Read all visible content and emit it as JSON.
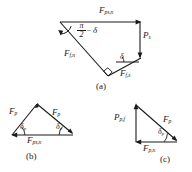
{
  "figure": {
    "background": "#ffffff",
    "line_color": "#1a1a1a",
    "text_color": "#1a1a1a"
  },
  "panels": [
    {
      "id": "a",
      "caption": "(a)",
      "labels": {
        "top_force": "F",
        "top_force_sub": "ps,n",
        "right_force": "P",
        "right_force_sub": "s",
        "left_force": "F",
        "left_force_sub": "f,n",
        "lower_force": "F",
        "lower_force_sub": "f,s",
        "angle_numerator": "π",
        "angle_denominator": "2",
        "angle_minus": "−",
        "angle_delta": "δ",
        "angle_delta_lower": "δ",
        "right_angle_marker": "right-angle"
      }
    },
    {
      "id": "b",
      "caption": "(b)",
      "labels": {
        "left_force": "F",
        "left_force_sub": "p",
        "right_force": "F",
        "right_force_sub": "p",
        "base_force": "F",
        "base_force_sub": "ps,n",
        "left_angle": "δ",
        "left_angle_sub": "p",
        "right_angle": "δ",
        "right_angle_sub": "p"
      }
    },
    {
      "id": "c",
      "caption": "(c)",
      "labels": {
        "vertical_force": "P",
        "vertical_force_sub": "p,f",
        "hyp_force": "F",
        "hyp_force_sub": "p",
        "base_force": "F",
        "base_force_sub": "p,n",
        "angle": "δ",
        "angle_sub": "p"
      }
    }
  ]
}
